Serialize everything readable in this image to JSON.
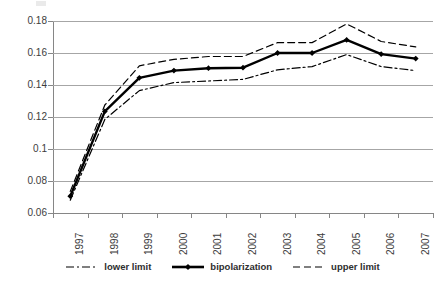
{
  "chart_data": {
    "type": "line",
    "title": "",
    "subtitle": "",
    "xlabel": "",
    "ylabel": "",
    "categories": [
      "1997",
      "1998",
      "1999",
      "2000",
      "2001",
      "2002",
      "2003",
      "2004",
      "2005",
      "2006",
      "2007"
    ],
    "series": [
      {
        "name": "lower limit",
        "style": "dash-dot",
        "color": "#000000",
        "values": [
          0.068,
          0.1185,
          0.1365,
          0.1415,
          0.1425,
          0.1435,
          0.1495,
          0.1515,
          0.159,
          0.1515,
          0.149
        ]
      },
      {
        "name": "bipolarization",
        "style": "solid",
        "color": "#000000",
        "marker": "diamond",
        "values": [
          0.0705,
          0.1235,
          0.1445,
          0.149,
          0.1505,
          0.1508,
          0.16,
          0.16,
          0.1682,
          0.1593,
          0.1565
        ]
      },
      {
        "name": "upper limit",
        "style": "dashed",
        "color": "#000000",
        "values": [
          0.0735,
          0.1275,
          0.152,
          0.156,
          0.1578,
          0.1578,
          0.1665,
          0.1665,
          0.1782,
          0.1672,
          0.1638
        ]
      }
    ],
    "ylim": [
      0.06,
      0.18
    ],
    "ytick_labels": [
      "0.18",
      "0.16",
      "0.14",
      "0.12",
      "0.1",
      "0.08",
      "0.06"
    ],
    "ytick_values": [
      0.18,
      0.16,
      0.14,
      0.12,
      0.1,
      0.08,
      0.06
    ],
    "grid": true,
    "grid_axis": "y",
    "legend_position": "bottom",
    "legend_entries": [
      "lower limit",
      "bipolarization",
      "upper limit"
    ],
    "background_color": "#ffffff",
    "gridline_color": "#a6a6a6",
    "axis_color": "#868686"
  }
}
